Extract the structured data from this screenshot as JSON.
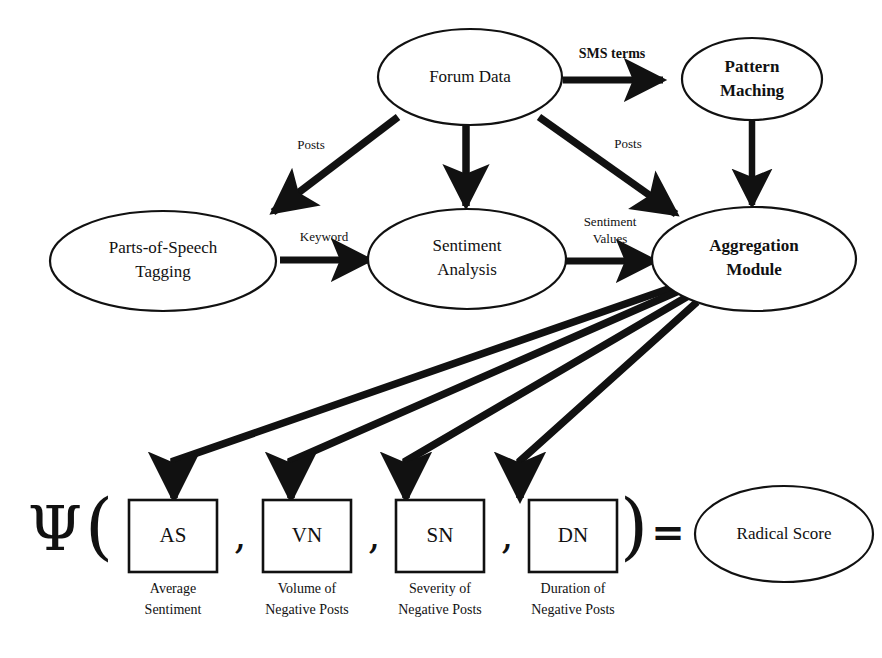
{
  "diagram": {
    "background_color": "#ffffff",
    "stroke_color": "#111111",
    "nodes": {
      "forum_data": {
        "label": "Forum Data",
        "shape": "ellipse",
        "weight": "regular"
      },
      "pattern_matching": {
        "label_line1": "Pattern",
        "label_line2": "Maching",
        "shape": "ellipse",
        "weight": "bold"
      },
      "pos_tagging": {
        "label_line1": "Parts-of-Speech",
        "label_line2": "Tagging",
        "shape": "ellipse",
        "weight": "regular"
      },
      "sentiment_analysis": {
        "label_line1": "Sentiment",
        "label_line2": "Analysis",
        "shape": "ellipse",
        "weight": "regular"
      },
      "aggregation_module": {
        "label_line1": "Aggregation",
        "label_line2": "Module",
        "shape": "ellipse",
        "weight": "bold"
      },
      "radical_score": {
        "label": "Radical Score",
        "shape": "ellipse",
        "weight": "regular"
      }
    },
    "edge_labels": {
      "sms_terms": "SMS terms",
      "posts_left": "Posts",
      "posts_right": "Posts",
      "keyword": "Keyword",
      "sentiment_values_line1": "Sentiment",
      "sentiment_values_line2": "Values"
    },
    "formula": {
      "function_symbol": "Ψ",
      "open_paren": "(",
      "close_paren": ")",
      "equals": "=",
      "separator": ",",
      "terms": [
        {
          "code": "AS",
          "caption_line1": "Average",
          "caption_line2": "Sentiment"
        },
        {
          "code": "VN",
          "caption_line1": "Volume of",
          "caption_line2": "Negative Posts"
        },
        {
          "code": "SN",
          "caption_line1": "Severity of",
          "caption_line2": "Negative Posts"
        },
        {
          "code": "DN",
          "caption_line1": "Duration of",
          "caption_line2": "Negative Posts"
        }
      ]
    }
  }
}
